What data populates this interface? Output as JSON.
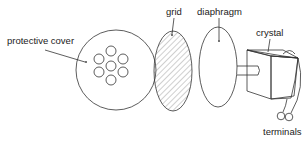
{
  "diagram": {
    "labels": {
      "protective_cover": "protective cover",
      "grid": "grid",
      "diaphragm": "diaphragm",
      "crystal": "crystal",
      "terminals": "terminals"
    },
    "components": [
      {
        "id": "protective-cover",
        "shape": "circle with 7 holes"
      },
      {
        "id": "grid",
        "shape": "hatched ellipse"
      },
      {
        "id": "diaphragm",
        "shape": "ellipse"
      },
      {
        "id": "crystal",
        "shape": "box with rod connecting to diaphragm"
      },
      {
        "id": "terminals",
        "shape": "two loops on wires"
      }
    ],
    "colors": {
      "stroke": "#333333",
      "background": "#ffffff"
    }
  }
}
